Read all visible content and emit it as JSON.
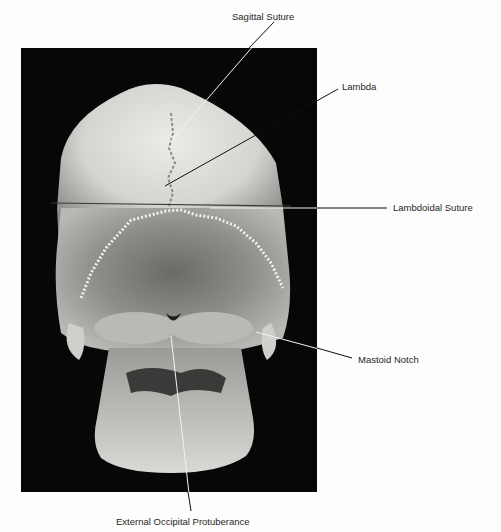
{
  "figure": {
    "labels": {
      "sagittal_suture": "Sagittal Suture",
      "lambda": "Lambda",
      "lambdoidal_suture": "Lambdoidal Suture",
      "mastoid_notch": "Mastoid Notch",
      "external_occipital_protuberance": "External Occipital Protuberance"
    },
    "colors": {
      "background": "#fdfdfd",
      "photo_background": "#070707",
      "bone_light": "#e6e6e2",
      "bone_mid": "#a9a9a5",
      "bone_dark": "#5a5a58",
      "leader_line": "#111111",
      "leader_line_on_dark": "#f2f2f2"
    }
  }
}
